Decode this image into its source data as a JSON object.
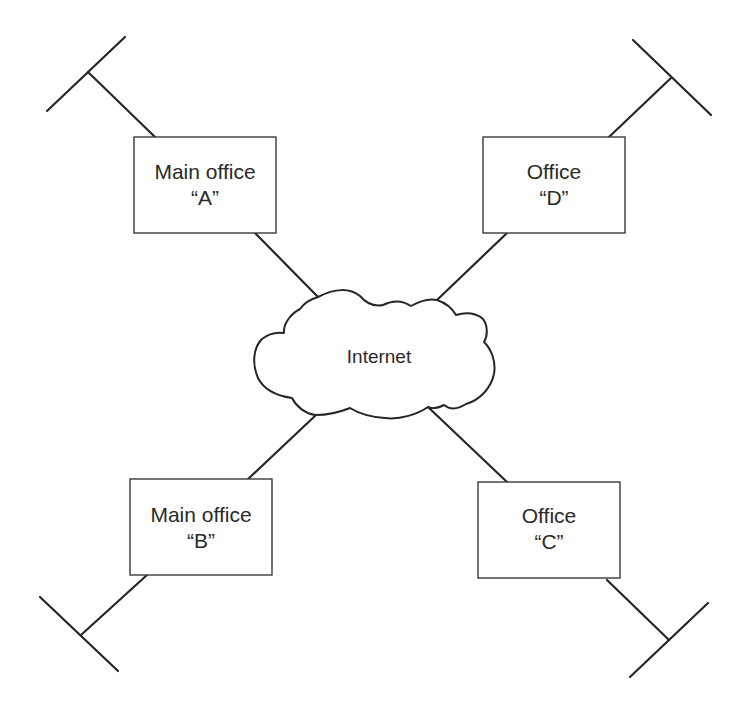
{
  "diagram": {
    "type": "network-topology",
    "colors": {
      "line": "#262626",
      "box_border": "#3a3a3a",
      "text": "#2a2a2a",
      "background": "#ffffff"
    },
    "cloud": {
      "label": "Internet"
    },
    "offices": [
      {
        "id": "A",
        "line1": "Main office",
        "line2": "“A”",
        "position": "top-left"
      },
      {
        "id": "D",
        "line1": "Office",
        "line2": "“D”",
        "position": "top-right"
      },
      {
        "id": "B",
        "line1": "Main office",
        "line2": "“B”",
        "position": "bottom-left"
      },
      {
        "id": "C",
        "line1": "Office",
        "line2": "“C”",
        "position": "bottom-right"
      }
    ],
    "connections": [
      {
        "from": "A",
        "to": "Internet"
      },
      {
        "from": "D",
        "to": "Internet"
      },
      {
        "from": "B",
        "to": "Internet"
      },
      {
        "from": "C",
        "to": "Internet"
      }
    ],
    "lan_segments": [
      {
        "office": "A",
        "shape": "T-bus"
      },
      {
        "office": "D",
        "shape": "T-bus"
      },
      {
        "office": "B",
        "shape": "T-bus"
      },
      {
        "office": "C",
        "shape": "T-bus"
      }
    ]
  }
}
